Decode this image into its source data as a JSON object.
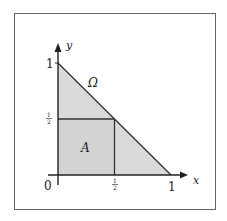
{
  "figure": {
    "x_axis_label": "x",
    "y_axis_label": "y",
    "origin_label": "0",
    "x_tick_one": "1",
    "y_tick_one": "1",
    "half_numerator": "1",
    "half_denominator": "2",
    "region_omega_label": "Ω",
    "region_a_label": "A",
    "colors": {
      "fill": "#d9d9d9",
      "line": "#333333",
      "frame": "#555555"
    }
  },
  "chart_data": {
    "type": "diagram",
    "title": "",
    "xlabel": "x",
    "ylabel": "y",
    "xlim": [
      0,
      1
    ],
    "ylim": [
      0,
      1
    ],
    "x_ticks": [
      "0",
      "1/2",
      "1"
    ],
    "y_ticks": [
      "1/2",
      "1"
    ],
    "regions": [
      {
        "name": "Ω",
        "shape": "triangle",
        "vertices": [
          [
            0,
            0
          ],
          [
            1,
            0
          ],
          [
            0,
            1
          ]
        ]
      },
      {
        "name": "A",
        "shape": "square",
        "vertices": [
          [
            0,
            0
          ],
          [
            0.5,
            0
          ],
          [
            0.5,
            0.5
          ],
          [
            0,
            0.5
          ]
        ]
      }
    ]
  }
}
